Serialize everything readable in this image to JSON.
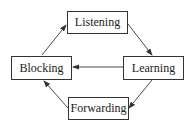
{
  "diagram": {
    "nodes": [
      {
        "id": "listening",
        "label": "Listening",
        "x": 67,
        "y": 11,
        "w": 61,
        "h": 23
      },
      {
        "id": "blocking",
        "label": "Blocking",
        "x": 11,
        "y": 56,
        "w": 61,
        "h": 24
      },
      {
        "id": "learning",
        "label": "Learning",
        "x": 123,
        "y": 56,
        "w": 61,
        "h": 24
      },
      {
        "id": "forwarding",
        "label": "Forwarding",
        "x": 68,
        "y": 97,
        "w": 61,
        "h": 23
      }
    ],
    "edges": [
      {
        "from": "listening",
        "to": "learning"
      },
      {
        "from": "learning",
        "to": "blocking"
      },
      {
        "from": "learning",
        "to": "forwarding"
      },
      {
        "from": "forwarding",
        "to": "blocking"
      },
      {
        "from": "blocking",
        "to": "listening"
      }
    ],
    "colors": {
      "stroke": "#333333",
      "background": "#ffffff"
    }
  }
}
